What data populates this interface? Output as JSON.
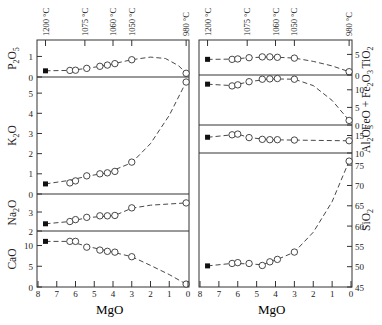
{
  "chart_data": {
    "type": "line",
    "title": "",
    "xlabel": "MgO",
    "xlim": [
      8,
      0
    ],
    "x_ticks": [
      8,
      7,
      6,
      5,
      4,
      3,
      2,
      1,
      0
    ],
    "temperature_axis": {
      "labels": [
        "1200 °C",
        "1075 °C",
        "1060 °C",
        "1050 °C",
        "980 °C"
      ],
      "mgo_positions": [
        7.6,
        5.5,
        4.0,
        3.0,
        0.1
      ]
    },
    "legend": [
      {
        "marker": "filled-square",
        "meaning": "starting composition"
      },
      {
        "marker": "open-circle",
        "meaning": "experimental glass"
      }
    ],
    "columns": [
      {
        "name": "left",
        "panels": [
          {
            "ylabel": "P2O5",
            "ylabel_html": [
              "P",
              "2",
              "O",
              "5"
            ],
            "ylim": [
              0,
              1.8
            ],
            "yticks": [
              0,
              1
            ],
            "starting": {
              "x": 7.6,
              "y": 0.3
            },
            "x": [
              6.3,
              6.0,
              5.4,
              4.7,
              4.3,
              3.9,
              3.0,
              0.1
            ],
            "y": [
              0.32,
              0.33,
              0.42,
              0.52,
              0.58,
              0.65,
              0.84,
              0.18
            ],
            "curve": [
              [
                7.6,
                0.3
              ],
              [
                6.3,
                0.32
              ],
              [
                5.4,
                0.42
              ],
              [
                4.3,
                0.58
              ],
              [
                3.0,
                0.84
              ],
              [
                2.0,
                0.97
              ],
              [
                1.2,
                0.9
              ],
              [
                0.5,
                0.55
              ],
              [
                0.1,
                0.18
              ]
            ]
          },
          {
            "ylabel": "K2O",
            "ylabel_html": [
              "K",
              "2",
              "O"
            ],
            "ylim": [
              0,
              5.8
            ],
            "yticks": [
              0,
              1,
              2,
              3,
              4,
              5
            ],
            "starting": {
              "x": 7.6,
              "y": 0.5
            },
            "x": [
              6.3,
              6.0,
              5.4,
              4.7,
              4.3,
              3.9,
              3.0,
              0.1
            ],
            "y": [
              0.55,
              0.65,
              0.9,
              1.0,
              1.05,
              1.12,
              1.58,
              5.55
            ],
            "curve": [
              [
                7.6,
                0.5
              ],
              [
                6.3,
                0.68
              ],
              [
                5.4,
                0.88
              ],
              [
                4.3,
                1.05
              ],
              [
                3.0,
                1.55
              ],
              [
                2.0,
                2.5
              ],
              [
                1.0,
                3.9
              ],
              [
                0.1,
                5.55
              ]
            ]
          },
          {
            "ylabel": "Na2O",
            "ylabel_html": [
              "Na",
              "2",
              "O"
            ],
            "ylim": [
              2,
              3.95
            ],
            "yticks": [
              2,
              3
            ],
            "starting": {
              "x": 7.6,
              "y": 2.38
            },
            "x": [
              6.3,
              6.0,
              5.4,
              4.7,
              4.3,
              3.9,
              3.0,
              0.1
            ],
            "y": [
              2.5,
              2.6,
              2.72,
              2.8,
              2.8,
              2.82,
              3.22,
              3.48
            ],
            "curve": [
              [
                7.6,
                2.38
              ],
              [
                6.3,
                2.5
              ],
              [
                5.4,
                2.7
              ],
              [
                3.9,
                2.82
              ],
              [
                3.0,
                3.2
              ],
              [
                2.0,
                3.36
              ],
              [
                0.1,
                3.48
              ]
            ]
          },
          {
            "ylabel": "CaO",
            "ylabel_html": [
              "CaO"
            ],
            "ylim": [
              0,
              13.5
            ],
            "yticks": [
              0,
              5,
              10
            ],
            "starting": {
              "x": 7.6,
              "y": 11.0
            },
            "x": [
              6.3,
              6.0,
              5.4,
              4.7,
              4.3,
              3.9,
              3.0,
              0.1
            ],
            "y": [
              11.0,
              11.0,
              9.6,
              8.9,
              8.6,
              8.4,
              7.3,
              0.7
            ],
            "curve": [
              [
                7.6,
                11.0
              ],
              [
                6.3,
                11.0
              ],
              [
                5.4,
                9.8
              ],
              [
                4.3,
                8.7
              ],
              [
                3.0,
                7.3
              ],
              [
                2.0,
                5.2
              ],
              [
                1.0,
                3.0
              ],
              [
                0.1,
                0.7
              ]
            ]
          }
        ]
      },
      {
        "name": "right",
        "panels": [
          {
            "ylabel": "TiO2",
            "ylabel_html": [
              "TiO",
              "2"
            ],
            "ylim": [
              0,
              8.5
            ],
            "yticks": [
              0,
              5
            ],
            "starting": {
              "x": 7.6,
              "y": 3.8
            },
            "x": [
              6.3,
              6.0,
              5.4,
              4.7,
              4.3,
              3.9,
              3.0,
              0.1
            ],
            "y": [
              3.8,
              3.9,
              4.2,
              4.4,
              4.4,
              4.3,
              4.1,
              0.8
            ],
            "curve": [
              [
                7.6,
                3.8
              ],
              [
                6.3,
                3.85
              ],
              [
                5.4,
                4.2
              ],
              [
                4.3,
                4.4
              ],
              [
                3.0,
                4.1
              ],
              [
                2.0,
                3.3
              ],
              [
                1.0,
                2.2
              ],
              [
                0.1,
                0.8
              ]
            ]
          },
          {
            "ylabel": "FeO + Fe2O3",
            "ylabel_html": [
              "FeO + Fe",
              "2",
              "O",
              "3"
            ],
            "ylim": [
              0,
              14.2
            ],
            "yticks": [
              0,
              5,
              10
            ],
            "starting": {
              "x": 7.6,
              "y": 11.6
            },
            "x": [
              6.3,
              6.0,
              5.4,
              4.7,
              4.3,
              3.9,
              3.0,
              0.1
            ],
            "y": [
              11.1,
              11.4,
              12.3,
              13.0,
              13.1,
              13.2,
              13.0,
              1.3
            ],
            "curve": [
              [
                7.6,
                11.6
              ],
              [
                6.3,
                11.2
              ],
              [
                5.4,
                12.3
              ],
              [
                4.3,
                13.1
              ],
              [
                3.0,
                13.0
              ],
              [
                2.0,
                11.2
              ],
              [
                1.0,
                7.0
              ],
              [
                0.1,
                1.3
              ]
            ]
          },
          {
            "ylabel": "Al2O3",
            "ylabel_html": [
              "Al",
              "2",
              "O",
              "3"
            ],
            "ylim": [
              10,
              18
            ],
            "yticks": [
              10,
              15
            ],
            "starting": {
              "x": 7.6,
              "y": 14.5
            },
            "x": [
              6.3,
              6.0,
              5.4,
              4.7,
              4.3,
              3.9,
              3.0,
              0.1
            ],
            "y": [
              15.2,
              15.4,
              14.4,
              13.9,
              13.8,
              13.8,
              13.7,
              13.5
            ],
            "curve": [
              [
                7.6,
                14.5
              ],
              [
                6.3,
                15.2
              ],
              [
                6.0,
                15.4
              ],
              [
                5.4,
                14.4
              ],
              [
                4.3,
                13.8
              ],
              [
                3.0,
                13.7
              ],
              [
                0.1,
                13.5
              ]
            ]
          },
          {
            "ylabel": "SiO2",
            "ylabel_html": [
              "SiO",
              "2"
            ],
            "ylim": [
              45,
              78
            ],
            "yticks": [
              45,
              50,
              55,
              60,
              65,
              70,
              75
            ],
            "starting": {
              "x": 7.6,
              "y": 50.2
            },
            "x": [
              6.3,
              6.0,
              5.4,
              4.7,
              4.3,
              3.9,
              3.0,
              0.1
            ],
            "y": [
              50.8,
              51.0,
              50.8,
              50.3,
              51.2,
              51.8,
              53.6,
              76.0
            ],
            "curve": [
              [
                7.6,
                50.2
              ],
              [
                6.3,
                50.8
              ],
              [
                5.4,
                50.7
              ],
              [
                4.7,
                50.5
              ],
              [
                3.9,
                51.8
              ],
              [
                3.0,
                53.6
              ],
              [
                2.0,
                58.5
              ],
              [
                1.0,
                66.0
              ],
              [
                0.1,
                76.0
              ]
            ]
          }
        ]
      }
    ]
  },
  "labels": {
    "xlabel_left": "MgO",
    "xlabel_right": "MgO"
  }
}
